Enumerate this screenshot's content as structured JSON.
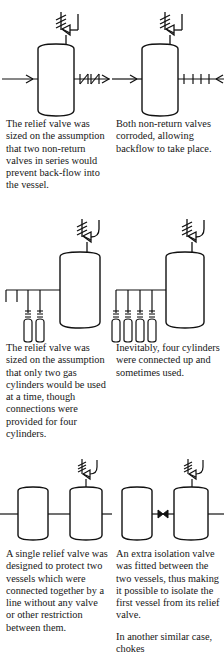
{
  "figure": {
    "kind": "process-safety-illustration",
    "ink_color": "#111111",
    "background_color": "#ffffff"
  },
  "rows": [
    {
      "id": "row-relief-valve-nonreturn",
      "left": {
        "diagram_name": "vessel-with-two-non-return-valves",
        "symbols": [
          "relief-valve",
          "vessel",
          "inlet-arrow",
          "non-return-valve",
          "non-return-valve",
          "outlet-arrow"
        ],
        "caption": "The relief valve was sized on the assumption that two non-return valves in series would prevent back-flow into the vessel."
      },
      "right": {
        "diagram_name": "vessel-with-corroded-non-return-valves",
        "symbols": [
          "relief-valve",
          "vessel",
          "inlet-arrow",
          "corroded-valve",
          "corroded-valve",
          "backflow-arrow"
        ],
        "caption": "Both non-return valves corroded, allowing backflow to take place."
      }
    },
    {
      "id": "row-gas-cylinders",
      "left": {
        "diagram_name": "vessel-with-two-gas-cylinders",
        "symbols": [
          "relief-valve",
          "vessel",
          "manifold",
          "gas-cylinder",
          "gas-cylinder"
        ],
        "cylinder_count": 2,
        "connection_count": 4,
        "caption": "The relief valve was sized on the assumption that only two gas cylinders would be used at a time, though connections were provided for four cylinders."
      },
      "right": {
        "diagram_name": "vessel-with-four-gas-cylinders",
        "symbols": [
          "relief-valve",
          "vessel",
          "manifold",
          "gas-cylinder",
          "gas-cylinder",
          "gas-cylinder",
          "gas-cylinder"
        ],
        "cylinder_count": 4,
        "connection_count": 4,
        "caption": "Inevitably, four cylinders were connected up and sometimes used."
      }
    },
    {
      "id": "row-twin-vessels",
      "left": {
        "diagram_name": "twin-vessels-no-isolation-valve",
        "symbols": [
          "vessel",
          "vessel",
          "connecting-line",
          "relief-valve"
        ],
        "caption": "A single relief valve was designed to protect two vessels which were connected together by a line without any valve or other restriction between them."
      },
      "right": {
        "diagram_name": "twin-vessels-with-isolation-valve",
        "symbols": [
          "vessel",
          "vessel",
          "isolation-valve",
          "relief-valve"
        ],
        "caption": "An extra isolation valve was fitted between the two vessels, thus making it possible to isolate the first vessel from its relief valve.",
        "caption_continued": "In another similar case, chokes"
      }
    }
  ]
}
